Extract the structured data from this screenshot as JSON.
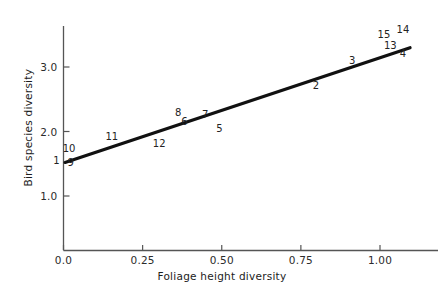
{
  "chart_data": {
    "type": "scatter",
    "title": "",
    "xlabel": "Foliage height diversity",
    "ylabel": "Bird species diversity",
    "xlim": [
      -0.06,
      1.16
    ],
    "ylim": [
      0.45,
      3.62
    ],
    "xticks": [
      0.0,
      0.25,
      0.5,
      0.75,
      1.0
    ],
    "xtick_labels": [
      "0.0",
      "0.25",
      "0.50",
      "0.75",
      "1.00"
    ],
    "yticks": [
      1.0,
      2.0,
      3.0
    ],
    "ytick_labels": [
      "1.0",
      "2.0",
      "3.0"
    ],
    "grid": false,
    "legend": null,
    "annotations": [
      {
        "label": "10",
        "x": 0.01,
        "y": 1.73
      },
      {
        "label": "1",
        "x": -0.02,
        "y": 1.55
      },
      {
        "label": "9",
        "x": 0.025,
        "y": 1.51
      },
      {
        "label": "11",
        "x": 0.145,
        "y": 1.92
      },
      {
        "label": "12",
        "x": 0.295,
        "y": 1.8
      },
      {
        "label": "8",
        "x": 0.365,
        "y": 2.28
      },
      {
        "label": "6",
        "x": 0.385,
        "y": 2.14
      },
      {
        "label": "7",
        "x": 0.45,
        "y": 2.26
      },
      {
        "label": "5",
        "x": 0.495,
        "y": 2.04
      },
      {
        "label": "2",
        "x": 0.8,
        "y": 2.7
      },
      {
        "label": "3",
        "x": 0.915,
        "y": 3.09
      },
      {
        "label": "15",
        "x": 1.005,
        "y": 3.5
      },
      {
        "label": "14",
        "x": 1.065,
        "y": 3.57
      },
      {
        "label": "13",
        "x": 1.025,
        "y": 3.33
      },
      {
        "label": "4",
        "x": 1.075,
        "y": 3.2
      }
    ],
    "regression_line": {
      "x_start": 0.005,
      "y_start": 1.52,
      "x_end": 1.095,
      "y_end": 3.3,
      "color": "#111111",
      "width": 3.2
    },
    "axis_color": "#555555",
    "text_color": "#232323"
  }
}
